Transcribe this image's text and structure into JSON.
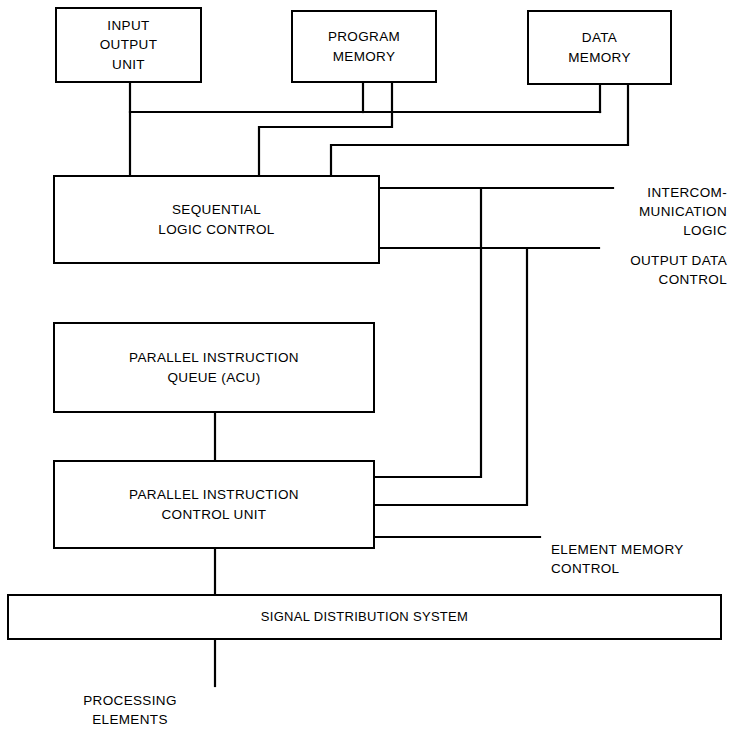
{
  "diagram": {
    "background_color": "#ffffff",
    "line_color": "#000000",
    "nodes": {
      "input_output_unit": "INPUT\nOUTPUT\nUNIT",
      "program_memory": "PROGRAM\nMEMORY",
      "data_memory": "DATA\nMEMORY",
      "sequential_logic_control": "SEQUENTIAL\nLOGIC CONTROL",
      "parallel_instruction_queue": "PARALLEL INSTRUCTION\nQUEUE (ACU)",
      "parallel_instruction_control_unit": "PARALLEL INSTRUCTION\nCONTROL UNIT",
      "signal_distribution_system": "SIGNAL DISTRIBUTION SYSTEM"
    },
    "edge_labels": {
      "intercommunication_logic": "INTERCOM-\nMUNICATION\nLOGIC",
      "output_data_control": "OUTPUT DATA\nCONTROL",
      "element_memory_control": "ELEMENT MEMORY\nCONTROL",
      "processing_elements": "PROCESSING\nELEMENTS"
    }
  }
}
